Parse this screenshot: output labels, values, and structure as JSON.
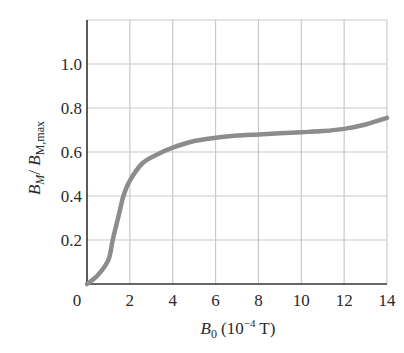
{
  "chart_data": {
    "type": "line",
    "title": "",
    "xlabel": "B_0 (10^-4 T)",
    "ylabel": "B_M / B_M,max",
    "xlim": [
      0,
      14
    ],
    "ylim": [
      0,
      1.2
    ],
    "grid": true,
    "x_ticks": [
      0,
      2,
      4,
      6,
      8,
      10,
      12,
      14
    ],
    "x_tick_labels": [
      "0",
      "2",
      "4",
      "6",
      "8",
      "10",
      "12",
      "14"
    ],
    "y_ticks": [
      0.2,
      0.4,
      0.6,
      0.8,
      1.0
    ],
    "y_tick_labels": [
      "0.2",
      "0.4",
      "0.6",
      "0.8",
      "1.0"
    ],
    "series": [
      {
        "name": "B_M / B_M,max",
        "color": "#8c8c8c",
        "x": [
          0,
          0.5,
          1.0,
          1.2,
          1.5,
          1.7,
          2.0,
          2.6,
          3.3,
          4.0,
          5.0,
          6.0,
          7.0,
          8.0,
          9.0,
          10.0,
          11.0,
          12.0,
          13.0,
          14.0
        ],
        "y": [
          0.0,
          0.04,
          0.11,
          0.2,
          0.32,
          0.4,
          0.47,
          0.55,
          0.59,
          0.62,
          0.65,
          0.665,
          0.675,
          0.68,
          0.685,
          0.69,
          0.695,
          0.705,
          0.725,
          0.755
        ]
      }
    ]
  },
  "labels": {
    "x_axis_main": "B",
    "x_axis_sub": "0",
    "x_axis_unit_pre": "(10",
    "x_axis_exp": "−4",
    "x_axis_unit_post": " T)",
    "y_axis_num": "B",
    "y_axis_num_sub": "M",
    "y_axis_slash": "/ ",
    "y_axis_den": "B",
    "y_axis_den_sub": "M,max"
  },
  "colors": {
    "curve": "#8c8c8c",
    "grid": "#c9c9c9",
    "axis": "#333333"
  }
}
